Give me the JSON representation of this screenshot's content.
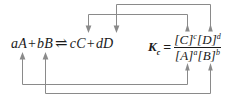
{
  "figure": {
    "line_color": "#8a8a8a",
    "text_color": "#1a1a1a",
    "background": "#ffffff"
  },
  "reaction": {
    "reactant_a_coefficient": "a",
    "reactant_a_species": "A",
    "plus_left": "+",
    "reactant_b_coefficient": "b",
    "reactant_b_species": "B",
    "equilibrium_arrow": "⇌",
    "product_c_coefficient": "c",
    "product_c_species": "C",
    "plus_right": "+",
    "product_d_coefficient": "d",
    "product_d_species": "D"
  },
  "kc": {
    "symbol": "K",
    "subscript": "c",
    "equals": "=",
    "numerator": {
      "bracket_c_open": "[",
      "species_c": "C",
      "bracket_c_close": "]",
      "exponent_c": "c",
      "bracket_d_open": "[",
      "species_d": "D",
      "bracket_d_close": "]",
      "exponent_d": "d"
    },
    "denominator": {
      "bracket_a_open": "[",
      "species_a": "A",
      "bracket_a_close": "]",
      "exponent_a": "a",
      "bracket_b_open": "[",
      "species_b": "B",
      "bracket_b_close": "]",
      "exponent_b": "b"
    }
  },
  "connectors": [
    {
      "name": "exponent-c-to-coefficient-c",
      "from": "numerator exponent c",
      "to": "product C coefficient c",
      "direction": "down"
    },
    {
      "name": "exponent-d-to-coefficient-d",
      "from": "numerator exponent d",
      "to": "product D coefficient d",
      "direction": "down"
    },
    {
      "name": "exponent-a-to-coefficient-a",
      "from": "denominator exponent a",
      "to": "reactant A coefficient a",
      "direction": "up"
    },
    {
      "name": "exponent-b-to-coefficient-b",
      "from": "denominator exponent b",
      "to": "reactant B coefficient b",
      "direction": "up"
    }
  ]
}
